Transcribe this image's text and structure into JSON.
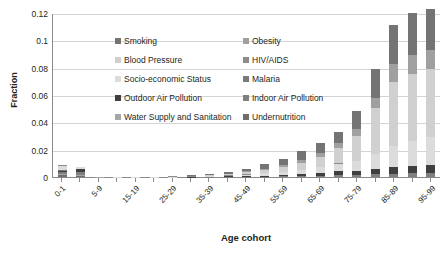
{
  "chart_data": {
    "type": "bar",
    "stacked": true,
    "title": "",
    "xlabel": "Age cohort",
    "ylabel": "Fraction",
    "ylim": [
      0,
      0.12
    ],
    "yticks": [
      "0",
      "0.02",
      "0.04",
      "0.06",
      "0.08",
      "0.1",
      "0.12"
    ],
    "ytick_values": [
      0,
      0.02,
      0.04,
      0.06,
      0.08,
      0.1,
      0.12
    ],
    "grid": true,
    "legend_position": "inside-top-left",
    "categories": [
      "0-1",
      "1-4",
      "5-9",
      "10-14",
      "15-19",
      "20-24",
      "25-29",
      "30-34",
      "35-39",
      "40-44",
      "45-49",
      "50-54",
      "55-59",
      "60-64",
      "65-69",
      "70-74",
      "75-79",
      "80-84",
      "85-89",
      "90-94",
      "95-99"
    ],
    "xtick_labels": [
      "0-1",
      "",
      "5-9",
      "",
      "15-19",
      "",
      "25-29",
      "",
      "35-39",
      "",
      "45-49",
      "",
      "55-59",
      "",
      "65-69",
      "",
      "75-79",
      "",
      "85-89",
      "",
      "95-99"
    ],
    "series": [
      {
        "name": "Undernutrition",
        "color": "#6e6e6e",
        "values": [
          0.0012,
          0.001,
          0.0,
          0.0,
          0.0,
          0.0,
          0.0,
          0.0,
          0.0,
          0.0,
          0.0,
          0.0,
          0.0,
          0.0,
          0.0,
          0.0,
          0.0,
          0.0,
          0.0,
          0.0,
          0.0
        ]
      },
      {
        "name": "Water Supply and Sanitation",
        "color": "#a6a6a6",
        "values": [
          0.001,
          0.0008,
          0.0001,
          0.0,
          0.0,
          0.0,
          0.0,
          0.0,
          0.0,
          0.0,
          0.0,
          0.0,
          0.0,
          0.0,
          0.0,
          0.0,
          0.0,
          0.0,
          0.0,
          0.0,
          0.0
        ]
      },
      {
        "name": "Indoor Air Pollution",
        "color": "#7f7f7f",
        "values": [
          0.0018,
          0.0022,
          0.0001,
          0.0,
          0.0,
          0.0,
          0.0,
          0.0,
          0.0001,
          0.0001,
          0.0002,
          0.0003,
          0.0004,
          0.0006,
          0.0009,
          0.0012,
          0.0016,
          0.002,
          0.0024,
          0.0026,
          0.0028
        ]
      },
      {
        "name": "Outdoor Air Pollution",
        "color": "#3f3f3f",
        "values": [
          0.0005,
          0.0016,
          0.0001,
          0.0,
          0.0,
          0.0,
          0.0,
          0.0001,
          0.0002,
          0.0003,
          0.0005,
          0.0008,
          0.0012,
          0.0018,
          0.0024,
          0.0032,
          0.0028,
          0.0042,
          0.0052,
          0.0058,
          0.0062
        ]
      },
      {
        "name": "Malaria",
        "color": "#7a7a7a",
        "values": [
          0.0008,
          0.0004,
          0.0,
          0.0,
          0.0,
          0.0,
          0.0,
          0.0,
          0.0,
          0.0,
          0.0,
          0.0,
          0.0,
          0.0,
          0.0,
          0.0,
          0.0,
          0.0,
          0.0,
          0.0,
          0.0
        ]
      },
      {
        "name": "Socio-economic Status",
        "color": "#dcdcdc",
        "values": [
          0.003,
          0.0012,
          0.0001,
          0.0001,
          0.0001,
          0.0001,
          0.0001,
          0.0002,
          0.0003,
          0.0006,
          0.001,
          0.0016,
          0.0022,
          0.003,
          0.004,
          0.0055,
          0.0075,
          0.011,
          0.015,
          0.018,
          0.02
        ]
      },
      {
        "name": "HIV/AIDS",
        "color": "#8c8c8c",
        "values": [
          0.0002,
          0.0001,
          0.0,
          0.0,
          0.0001,
          0.0002,
          0.0003,
          0.0004,
          0.0004,
          0.0004,
          0.0003,
          0.0002,
          0.0002,
          0.0001,
          0.0001,
          0.0001,
          0.0,
          0.0,
          0.0,
          0.0,
          0.0
        ]
      },
      {
        "name": "Blood Pressure",
        "color": "#d0d0d0",
        "values": [
          0.0,
          0.0,
          0.0,
          0.0,
          0.0,
          0.0,
          0.0,
          0.0002,
          0.0004,
          0.0008,
          0.0014,
          0.0022,
          0.0032,
          0.0048,
          0.0072,
          0.011,
          0.018,
          0.033,
          0.047,
          0.049,
          0.05
        ]
      },
      {
        "name": "Obesity",
        "color": "#a0a0a0",
        "values": [
          0.0,
          0.0,
          0.0,
          0.0,
          0.0,
          0.0,
          0.0001,
          0.0001,
          0.0002,
          0.0004,
          0.0007,
          0.0011,
          0.0016,
          0.0022,
          0.003,
          0.004,
          0.0055,
          0.0075,
          0.013,
          0.014,
          0.014
        ]
      },
      {
        "name": "Smoking",
        "color": "#747474",
        "values": [
          0.0,
          0.0,
          0.0,
          0.0,
          0.0,
          0.0,
          0.0,
          0.0002,
          0.0005,
          0.001,
          0.0018,
          0.003,
          0.0042,
          0.0065,
          0.0074,
          0.008,
          0.013,
          0.021,
          0.029,
          0.031,
          0.03
        ]
      }
    ]
  },
  "legend": {
    "items": [
      {
        "label": "Smoking",
        "color": "#747474"
      },
      {
        "label": "Obesity",
        "color": "#a0a0a0"
      },
      {
        "label": "Blood Pressure",
        "color": "#d0d0d0"
      },
      {
        "label": "HIV/AIDS",
        "color": "#8c8c8c"
      },
      {
        "label": "Socio-economic Status",
        "color": "#dcdcdc"
      },
      {
        "label": "Malaria",
        "color": "#7a7a7a"
      },
      {
        "label": "Outdoor Air Pollution",
        "color": "#3f3f3f"
      },
      {
        "label": "Indoor Air Pollution",
        "color": "#7f7f7f"
      },
      {
        "label": "Water Supply and Sanitation",
        "color": "#a6a6a6"
      },
      {
        "label": "Undernutrition",
        "color": "#6e6e6e"
      }
    ]
  }
}
